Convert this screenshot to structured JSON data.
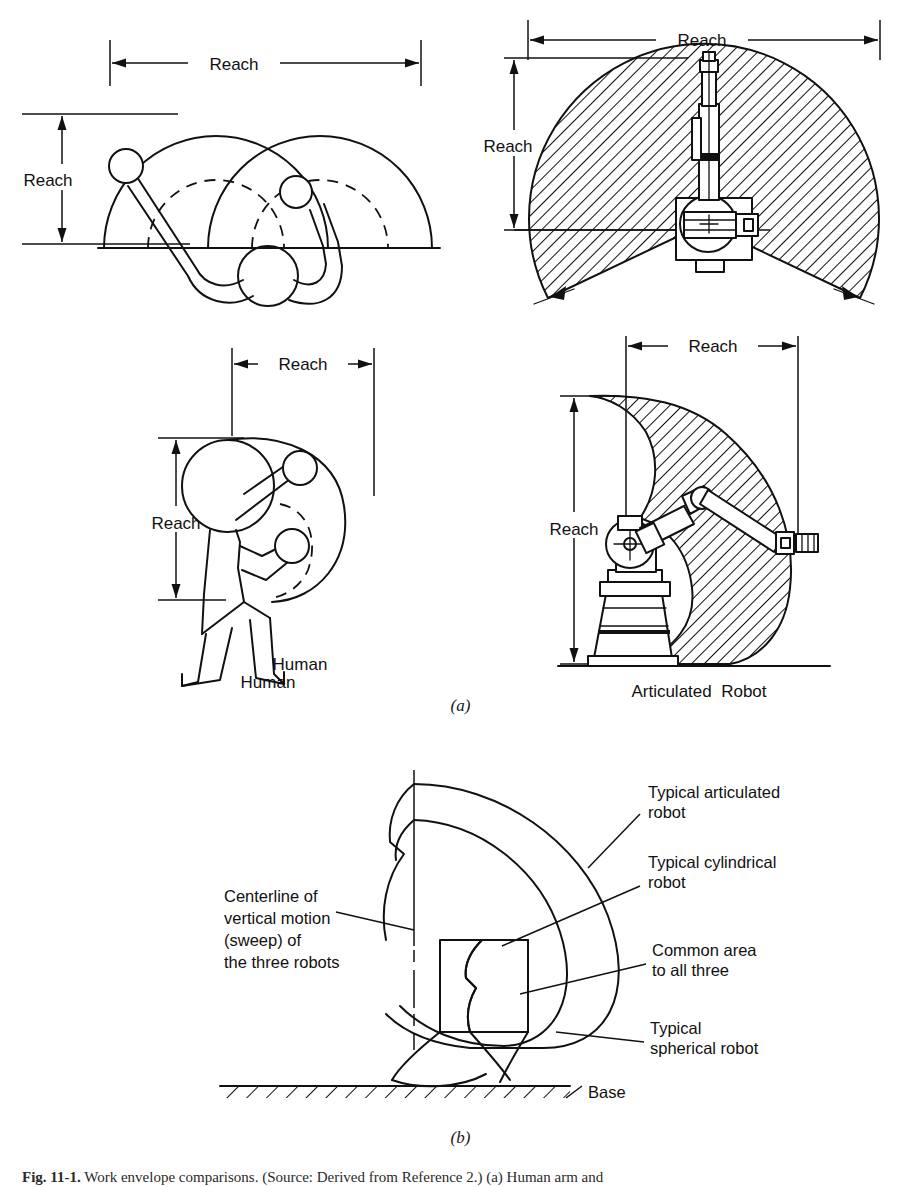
{
  "figure": {
    "caption_number": "Fig. 11-1.",
    "caption_text": "Work envelope comparisons. (Source: Derived from Reference 2.) (a) Human arm and",
    "panel_a_letter": "(a)",
    "panel_b_letter": "(b)"
  },
  "panel_a": {
    "top_left": {
      "name": "human-arm-top-view",
      "horizontal_dimension_label": "Reach",
      "vertical_dimension_label": "Reach"
    },
    "top_right": {
      "name": "robot-work-envelope-top-view",
      "horizontal_dimension_label": "Reach",
      "vertical_dimension_label": "Reach"
    },
    "bottom_left": {
      "name": "human-side-view",
      "horizontal_dimension_label": "Reach",
      "vertical_dimension_label": "Reach",
      "caption": "Human"
    },
    "bottom_right": {
      "name": "articulated-robot-side-view",
      "horizontal_dimension_label": "Reach",
      "vertical_dimension_label": "Reach",
      "caption": "Articulated  Robot"
    }
  },
  "panel_b": {
    "name": "combined-envelope-comparison",
    "labels": {
      "articulated": [
        "Typical articulated",
        "robot"
      ],
      "cylindrical": [
        "Typical cylindrical",
        "robot"
      ],
      "common_area": [
        "Common area",
        "to all three"
      ],
      "spherical": [
        "Typical",
        "spherical robot"
      ],
      "centerline": [
        "Centerline of",
        "vertical motion",
        "(sweep) of",
        "the three robots"
      ],
      "base": "Base"
    }
  },
  "colors": {
    "ink": "#111111",
    "paper": "#ffffff"
  }
}
